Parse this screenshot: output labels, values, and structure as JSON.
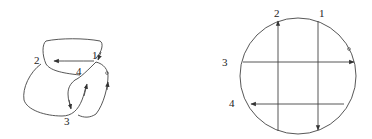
{
  "figure": {
    "left_panel": {
      "description": "Tangled curve with four numbered arrowed segments",
      "labels": [
        {
          "id": "1",
          "text": "1",
          "x": 92,
          "y": 59
        },
        {
          "id": "2",
          "text": "2",
          "x": 34,
          "y": 64
        },
        {
          "id": "3",
          "text": "3",
          "x": 64,
          "y": 125
        },
        {
          "id": "4",
          "text": "4",
          "x": 76,
          "y": 75
        }
      ],
      "base_point_marker": {
        "x": 107,
        "y": 73
      }
    },
    "right_panel": {
      "description": "Circle with two vertical and two horizontal arrowed chords",
      "circle": {
        "cx": 298,
        "cy": 76,
        "r": 58
      },
      "labels": [
        {
          "id": "1",
          "text": "1",
          "x": 319,
          "y": 17
        },
        {
          "id": "2",
          "text": "2",
          "x": 274,
          "y": 17
        },
        {
          "id": "3",
          "text": "3",
          "x": 222,
          "y": 66
        },
        {
          "id": "4",
          "text": "4",
          "x": 229,
          "y": 107
        }
      ],
      "chords": [
        {
          "id": "1",
          "orientation": "vertical",
          "direction": "down",
          "x": 318
        },
        {
          "id": "2",
          "orientation": "vertical",
          "direction": "up",
          "x": 278
        },
        {
          "id": "3",
          "orientation": "horizontal",
          "direction": "right",
          "y": 62
        },
        {
          "id": "4",
          "orientation": "horizontal",
          "direction": "left",
          "y": 104
        }
      ],
      "base_point_marker": {
        "x": 349,
        "y": 49
      }
    },
    "colors": {
      "line": "#444444",
      "text": "#222222",
      "background": "#ffffff"
    }
  }
}
